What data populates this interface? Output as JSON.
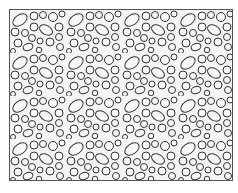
{
  "image": {
    "description": "Seamless pattern of outlined circles and ellipses (pebble/bubble texture) inside a rectangular border",
    "colors": {
      "background": "#ffffff",
      "fill": "#f4f4f4",
      "stroke": "#333333",
      "border": "#555555"
    }
  }
}
